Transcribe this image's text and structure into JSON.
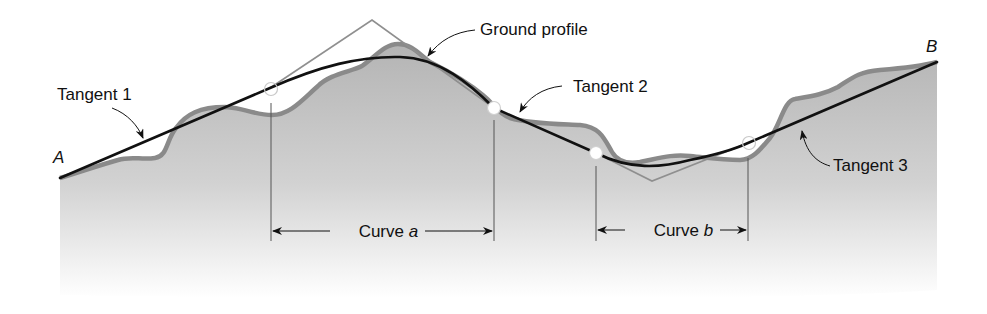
{
  "diagram": {
    "points": {
      "start": "A",
      "end": "B"
    },
    "labels": {
      "ground_profile": "Ground profile",
      "tangent_1": "Tangent 1",
      "tangent_2": "Tangent 2",
      "tangent_3": "Tangent 3",
      "curve_a_prefix": "Curve ",
      "curve_a_letter": "a",
      "curve_b_prefix": "Curve ",
      "curve_b_letter": "b"
    },
    "colors": {
      "ground_fill_top": "#b8b8b8",
      "ground_fill_bottom": "#ffffff",
      "ground_stroke": "#8a8a8a",
      "grade_line": "#111111",
      "tangent_construction": "#8f8f8f",
      "text": "#111111"
    }
  }
}
